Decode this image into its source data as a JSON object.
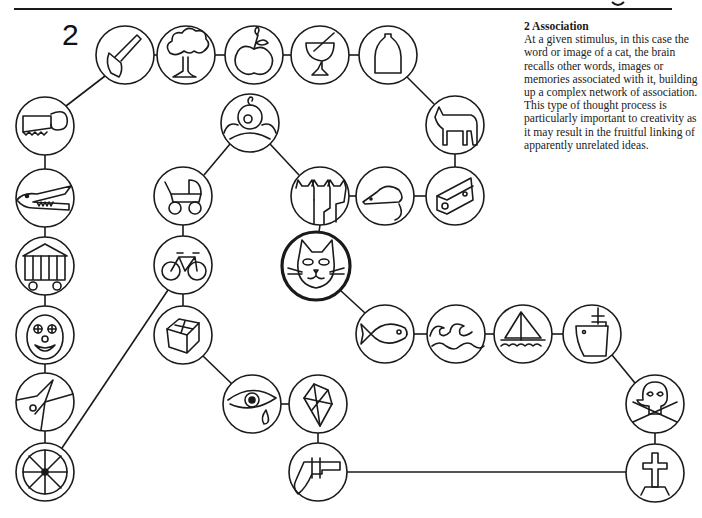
{
  "figure": {
    "number": "2",
    "caption_title": "2  Association",
    "caption_body": "At a given stimulus, in this case the word or image of a cat, the brain recalls other words, images or memories associated with it, building up a complex network of association. This type of thought process is particularly important to creativity as it may result in the fruitful linking of apparently unrelated ideas."
  },
  "nodes": [
    {
      "id": "axe",
      "label": "axe",
      "x": 125,
      "y": 55
    },
    {
      "id": "tree",
      "label": "tree",
      "x": 186,
      "y": 55
    },
    {
      "id": "apple",
      "label": "apple",
      "x": 254,
      "y": 55
    },
    {
      "id": "glass",
      "label": "glass",
      "x": 320,
      "y": 55
    },
    {
      "id": "bottle",
      "label": "bottle",
      "x": 388,
      "y": 55
    },
    {
      "id": "cow",
      "label": "cow",
      "x": 455,
      "y": 125
    },
    {
      "id": "cheese",
      "label": "cheese",
      "x": 455,
      "y": 196
    },
    {
      "id": "mouse",
      "label": "mouse",
      "x": 385,
      "y": 196
    },
    {
      "id": "cats",
      "label": "cats",
      "x": 320,
      "y": 196
    },
    {
      "id": "baby",
      "label": "baby",
      "x": 250,
      "y": 123
    },
    {
      "id": "pram",
      "label": "pram",
      "x": 183,
      "y": 196
    },
    {
      "id": "bicycle",
      "label": "bicycle",
      "x": 183,
      "y": 265
    },
    {
      "id": "box",
      "label": "box",
      "x": 183,
      "y": 335
    },
    {
      "id": "eye",
      "label": "eye",
      "x": 252,
      "y": 404
    },
    {
      "id": "diamond",
      "label": "diamond",
      "x": 318,
      "y": 404
    },
    {
      "id": "gun",
      "label": "gun",
      "x": 318,
      "y": 472
    },
    {
      "id": "cat",
      "label": "cat",
      "x": 316,
      "y": 266
    },
    {
      "id": "fish",
      "label": "fish",
      "x": 385,
      "y": 334
    },
    {
      "id": "waves",
      "label": "waves",
      "x": 456,
      "y": 334
    },
    {
      "id": "sailboat",
      "label": "sailboat",
      "x": 523,
      "y": 334
    },
    {
      "id": "ship",
      "label": "ship",
      "x": 592,
      "y": 334
    },
    {
      "id": "skull",
      "label": "skull and crossbones",
      "x": 655,
      "y": 404
    },
    {
      "id": "grave",
      "label": "grave cross",
      "x": 655,
      "y": 473
    },
    {
      "id": "saw",
      "label": "saw",
      "x": 45,
      "y": 126
    },
    {
      "id": "crocodile",
      "label": "crocodile",
      "x": 45,
      "y": 198
    },
    {
      "id": "wagon",
      "label": "circus wagon",
      "x": 45,
      "y": 266
    },
    {
      "id": "clown",
      "label": "clown",
      "x": 45,
      "y": 335
    },
    {
      "id": "acrobat",
      "label": "acrobat",
      "x": 45,
      "y": 402
    },
    {
      "id": "wheel",
      "label": "wheel",
      "x": 45,
      "y": 472
    }
  ],
  "stimulus": "cat"
}
